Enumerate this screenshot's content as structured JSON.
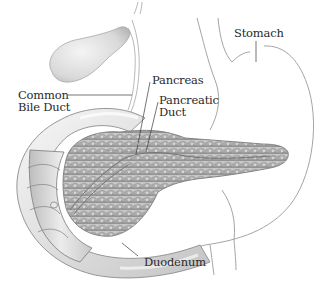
{
  "diagram": {
    "style": "grayscale medical illustration",
    "background_color": "#ffffff",
    "line_color": "#9a9a9a",
    "text_color": "#2a2a2a",
    "labels": {
      "stomach": {
        "text": "Stomach",
        "lines": [
          "Stomach"
        ]
      },
      "common_bile_duct": {
        "text": "Common Bile Duct",
        "lines": [
          "Common",
          "Bile Duct"
        ]
      },
      "pancreas": {
        "text": "Pancreas",
        "lines": [
          "Pancreas"
        ]
      },
      "pancreatic_duct": {
        "text": "Pancreatic Duct",
        "lines": [
          "Pancreatic",
          "Duct"
        ]
      },
      "duodenum": {
        "text": "Duodenum",
        "lines": [
          "Duodenum"
        ]
      }
    },
    "structures": [
      "gallbladder",
      "common bile duct",
      "stomach outline",
      "pancreas",
      "pancreatic duct",
      "duodenum"
    ]
  }
}
